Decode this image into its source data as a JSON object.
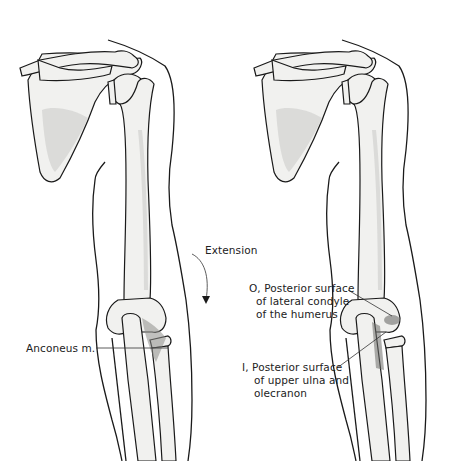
{
  "figure": {
    "panels": [
      {
        "id": "left",
        "subject": "right arm posterior view with anconeus muscle",
        "labels": {
          "motion": "Extension",
          "muscle": "Anconeus m."
        }
      },
      {
        "id": "right",
        "subject": "right arm posterior view showing origin and insertion",
        "labels": {
          "origin_line1": "O, Posterior surface",
          "origin_line2": "of lateral condyle",
          "origin_line3": "of the humerus",
          "insertion_line1": "I, Posterior surface",
          "insertion_line2": "of upper ulna and",
          "insertion_line3": "olecranon"
        }
      }
    ],
    "colors": {
      "line": "#1a1a1a",
      "bone_fill": "#f1f1ef",
      "shade": "#c9c9c6",
      "background": "#ffffff"
    }
  }
}
